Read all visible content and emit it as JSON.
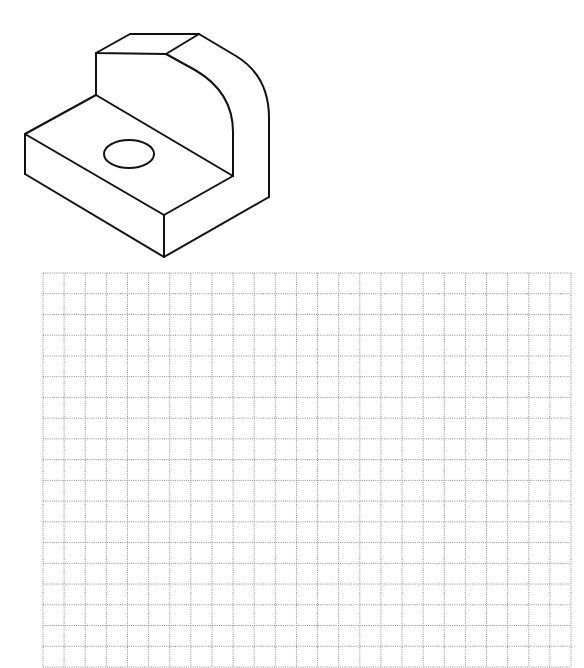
{
  "figure": {
    "type": "isometric-drawing",
    "line_color": "#111111",
    "edges": {
      "upright_top_face": [
        [
          130,
          34
        ],
        [
          199,
          34
        ],
        [
          166,
          54
        ],
        [
          96,
          53
        ]
      ],
      "upright_left_edge": [
        [
          96,
          53
        ],
        [
          96,
          95
        ]
      ],
      "base_top_back_edge": [
        [
          96,
          95
        ],
        [
          233,
          176
        ]
      ],
      "base_top_left_edge": [
        [
          96,
          95
        ],
        [
          25,
          134
        ]
      ],
      "base_left_vertical": [
        [
          25,
          134
        ],
        [
          25,
          174
        ]
      ],
      "base_top_front_edge": [
        [
          25,
          134
        ],
        [
          164,
          215
        ]
      ],
      "base_front_right_edge": [
        [
          164,
          215
        ],
        [
          233,
          176
        ]
      ],
      "base_front_vertical": [
        [
          164,
          215
        ],
        [
          164,
          257
        ]
      ],
      "base_bottom_front_edge": [
        [
          25,
          174
        ],
        [
          164,
          257
        ]
      ],
      "base_bottom_right_edge": [
        [
          164,
          257
        ],
        [
          269,
          197
        ]
      ],
      "inner_arc": "M166 54 L195 70 Q233 92 233 132 L233 176",
      "outer_arc": "M199 34 L236 56 Q269 76 269 118 L269 197"
    },
    "hole": {
      "cx": 129,
      "cy": 154,
      "rx": 25,
      "ry": 14
    }
  },
  "grid": {
    "type": "square-sketch-grid",
    "left": 43,
    "top": 273,
    "right": 571,
    "bottom": 667,
    "columns": 25,
    "rows": 19,
    "line_color": "#8a8a8a",
    "line_style": "dotted"
  }
}
